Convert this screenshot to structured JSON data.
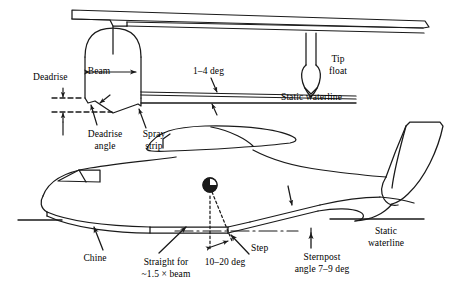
{
  "figure": {
    "line_color": "#1a1a1a",
    "background": "#ffffff",
    "width": 449,
    "height": 290
  },
  "views": {
    "front": {
      "name": "front-section-view",
      "description": "Front cross-section of hull showing beam, deadrise, spray strip, tip float and static waterline"
    },
    "side": {
      "name": "side-profile-view",
      "description": "Side profile of flying boat showing chine, step, sternpost angle and static waterline"
    }
  },
  "labels": {
    "deadrise": "Deadrise",
    "beam": "Beam",
    "deadrise_angle_line1": "Deadrise",
    "deadrise_angle_line2": "angle",
    "spray_strip_line1": "Spray",
    "spray_strip_line2": "strip",
    "one_to_four_deg": "1–4 deg",
    "tip_float_line1": "Tip",
    "tip_float_line2": "float",
    "static_waterline_top": "Static waterline",
    "static_waterline_bottom_line1": "Static",
    "static_waterline_bottom_line2": "waterline",
    "chine": "Chine",
    "straight_for_line1": "Straight for",
    "straight_for_line2": "~1.5 × beam",
    "ten_to_twenty_deg": "10–20 deg",
    "step": "Step",
    "sternpost_line1": "Sternpost",
    "sternpost_line2": "angle 7–9 deg"
  },
  "annotations": {
    "beam_dimension": {
      "label": "Beam",
      "type": "double-arrow-dimension"
    },
    "deadrise_height": {
      "label": "Deadrise",
      "type": "vertical-dimension"
    },
    "trim_angle": {
      "value_text": "1–4 deg",
      "range": [
        1,
        4
      ],
      "unit": "deg"
    },
    "forebody_keel_angle": {
      "value_text": "10–20 deg",
      "range": [
        10,
        20
      ],
      "unit": "deg"
    },
    "sternpost_angle": {
      "value_text": "7–9 deg",
      "range": [
        7,
        9
      ],
      "unit": "deg"
    },
    "straight_keel_length": {
      "value_text": "~1.5 × beam",
      "multiplier": 1.5,
      "reference": "beam"
    },
    "cg_marker": {
      "name": "center-of-gravity-symbol",
      "type": "quartered-circle"
    }
  }
}
